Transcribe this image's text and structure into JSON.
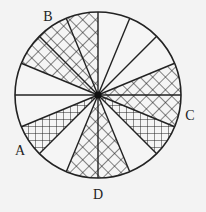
{
  "figure": {
    "circle": {
      "cx": 98,
      "cy": 95,
      "r": 83
    },
    "sector_count": 16,
    "sector_angle_deg": 22.5,
    "colors": {
      "background": "#f3f3f3",
      "line": "#222222",
      "fill": "#f5f5f5"
    },
    "sectors": [
      {
        "start": 0,
        "end": 22.5,
        "pattern": "diagonal"
      },
      {
        "start": 22.5,
        "end": 45,
        "pattern": "none"
      },
      {
        "start": 45,
        "end": 67.5,
        "pattern": "none"
      },
      {
        "start": 67.5,
        "end": 90,
        "pattern": "none"
      },
      {
        "start": 90,
        "end": 112.5,
        "pattern": "diagonal"
      },
      {
        "start": 112.5,
        "end": 135,
        "pattern": "diagonal"
      },
      {
        "start": 135,
        "end": 157.5,
        "pattern": "diagonal"
      },
      {
        "start": 157.5,
        "end": 180,
        "pattern": "none"
      },
      {
        "start": 180,
        "end": 202.5,
        "pattern": "none"
      },
      {
        "start": 202.5,
        "end": 225,
        "pattern": "grid"
      },
      {
        "start": 225,
        "end": 247.5,
        "pattern": "none"
      },
      {
        "start": 247.5,
        "end": 270,
        "pattern": "diagonal"
      },
      {
        "start": 270,
        "end": 292.5,
        "pattern": "diagonal"
      },
      {
        "start": 292.5,
        "end": 315,
        "pattern": "none"
      },
      {
        "start": 315,
        "end": 337.5,
        "pattern": "grid"
      },
      {
        "start": 337.5,
        "end": 360,
        "pattern": "diagonal"
      }
    ],
    "labels": [
      {
        "text": "B",
        "x": 48,
        "y": 21
      },
      {
        "text": "C",
        "x": 190,
        "y": 120
      },
      {
        "text": "A",
        "x": 20,
        "y": 155
      },
      {
        "text": "D",
        "x": 98,
        "y": 199
      }
    ]
  },
  "labels": {
    "a": "A",
    "b": "B",
    "c": "C",
    "d": "D"
  }
}
